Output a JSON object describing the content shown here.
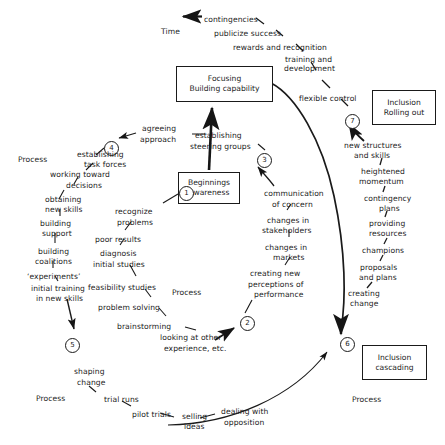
{
  "diagram": {
    "axis": {
      "time_label": "Time",
      "process_labels": [
        {
          "text": "Process",
          "x": 18,
          "y": 155
        },
        {
          "text": "Process",
          "x": 172,
          "y": 288
        },
        {
          "text": "Process",
          "x": 36,
          "y": 394
        },
        {
          "text": "Process",
          "x": 352,
          "y": 395
        }
      ]
    },
    "boxes": [
      {
        "id": "focusing",
        "line1": "Focusing",
        "line2": "Building capability",
        "x": 176,
        "y": 66,
        "w": 95,
        "h": 34
      },
      {
        "id": "beginnings",
        "line1": "Beginnings",
        "line2": "Awareness",
        "x": 178,
        "y": 172,
        "w": 60,
        "h": 30
      },
      {
        "id": "inclusion-rolling-out",
        "line1": "Inclusion",
        "line2": "Rolling out",
        "x": 372,
        "y": 90,
        "w": 62,
        "h": 33
      },
      {
        "id": "inclusion-cascading",
        "line1": "Inclusion",
        "line2": "cascading",
        "x": 362,
        "y": 345,
        "w": 63,
        "h": 33
      }
    ],
    "numbered_nodes": [
      {
        "number": "1",
        "x": 179,
        "y": 186
      },
      {
        "number": "2",
        "x": 240,
        "y": 316
      },
      {
        "number": "3",
        "x": 257,
        "y": 153
      },
      {
        "number": "4",
        "x": 104,
        "y": 141
      },
      {
        "number": "5",
        "x": 65,
        "y": 338
      },
      {
        "number": "6",
        "x": 340,
        "y": 337
      },
      {
        "number": "7",
        "x": 345,
        "y": 114
      }
    ],
    "labels": [
      {
        "id": "contingencies",
        "text": "contingencies",
        "x": 204,
        "y": 15
      },
      {
        "id": "time",
        "text": "Time",
        "x": 161,
        "y": 27
      },
      {
        "id": "publicize-success",
        "text": "publicize success",
        "x": 214,
        "y": 29
      },
      {
        "id": "rewards-and-recognition",
        "text": "rewards and recognition",
        "x": 233,
        "y": 43
      },
      {
        "id": "training-and",
        "text": "training and",
        "x": 285,
        "y": 55
      },
      {
        "id": "development",
        "text": "development",
        "x": 284,
        "y": 64
      },
      {
        "id": "flexible-control",
        "text": "flexible control",
        "x": 299,
        "y": 94
      },
      {
        "id": "new-structures",
        "text": "new structures",
        "x": 344,
        "y": 141
      },
      {
        "id": "and-skills",
        "text": "and skills",
        "x": 354,
        "y": 151
      },
      {
        "id": "heightened",
        "text": "heightened",
        "x": 361,
        "y": 167
      },
      {
        "id": "momentum",
        "text": "momentum",
        "x": 359,
        "y": 177
      },
      {
        "id": "contingency",
        "text": "contingency",
        "x": 364,
        "y": 194
      },
      {
        "id": "plans",
        "text": "plans",
        "x": 379,
        "y": 204
      },
      {
        "id": "providing",
        "text": "providing",
        "x": 369,
        "y": 219
      },
      {
        "id": "resources",
        "text": "resources",
        "x": 369,
        "y": 229
      },
      {
        "id": "champions",
        "text": "champions",
        "x": 362,
        "y": 246
      },
      {
        "id": "proposals",
        "text": "proposals",
        "x": 360,
        "y": 263
      },
      {
        "id": "and-plans",
        "text": "and plans",
        "x": 359,
        "y": 273
      },
      {
        "id": "creating",
        "text": "creating",
        "x": 348,
        "y": 289
      },
      {
        "id": "change",
        "text": "change",
        "x": 350,
        "y": 299
      },
      {
        "id": "agreeing",
        "text": "agreeing",
        "x": 142,
        "y": 124
      },
      {
        "id": "approach",
        "text": "approach",
        "x": 140,
        "y": 135
      },
      {
        "id": "establishing-steering",
        "text": "establishing",
        "x": 195,
        "y": 131
      },
      {
        "id": "steering-groups",
        "text": "steering groups",
        "x": 190,
        "y": 142
      },
      {
        "id": "establishing-task",
        "text": "establishing",
        "x": 77,
        "y": 150
      },
      {
        "id": "task-forces",
        "text": "task forces",
        "x": 84,
        "y": 160
      },
      {
        "id": "working-toward",
        "text": "working toward",
        "x": 50,
        "y": 170
      },
      {
        "id": "decisions",
        "text": "decisions",
        "x": 66,
        "y": 181
      },
      {
        "id": "obtaining",
        "text": "obtaining",
        "x": 45,
        "y": 195
      },
      {
        "id": "new-skills",
        "text": "new skills",
        "x": 45,
        "y": 205
      },
      {
        "id": "building-support-1",
        "text": "building",
        "x": 40,
        "y": 219
      },
      {
        "id": "support",
        "text": "support",
        "x": 42,
        "y": 229
      },
      {
        "id": "building-coalitions-1",
        "text": "building",
        "x": 38,
        "y": 247
      },
      {
        "id": "coalitions",
        "text": "coalitions",
        "x": 35,
        "y": 257
      },
      {
        "id": "experiments",
        "text": "‘experiments’",
        "x": 27,
        "y": 272
      },
      {
        "id": "initial-training",
        "text": "initial training",
        "x": 31,
        "y": 284
      },
      {
        "id": "in-new-skills",
        "text": "in new skills",
        "x": 36,
        "y": 294
      },
      {
        "id": "recognize",
        "text": "recognize",
        "x": 115,
        "y": 207
      },
      {
        "id": "problems",
        "text": "problems",
        "x": 117,
        "y": 218
      },
      {
        "id": "poor-results",
        "text": "poor results",
        "x": 95,
        "y": 235
      },
      {
        "id": "diagnosis",
        "text": "diagnosis",
        "x": 100,
        "y": 249
      },
      {
        "id": "initial-studies",
        "text": "initial studies",
        "x": 93,
        "y": 260
      },
      {
        "id": "feasibility-studies",
        "text": "feasibility studies",
        "x": 88,
        "y": 283
      },
      {
        "id": "problem-solving",
        "text": "problem solving",
        "x": 98,
        "y": 303
      },
      {
        "id": "brainstorming",
        "text": "brainstorming",
        "x": 117,
        "y": 322
      },
      {
        "id": "looking-at-other",
        "text": "looking at other",
        "x": 160,
        "y": 333
      },
      {
        "id": "experience-etc",
        "text": "experience, etc.",
        "x": 164,
        "y": 344
      },
      {
        "id": "communication",
        "text": "communication",
        "x": 264,
        "y": 189
      },
      {
        "id": "of-concern",
        "text": "of concern",
        "x": 272,
        "y": 200
      },
      {
        "id": "changes-in-stakeholders-1",
        "text": "changes in",
        "x": 267,
        "y": 216
      },
      {
        "id": "stakeholders",
        "text": "stakeholders",
        "x": 262,
        "y": 226
      },
      {
        "id": "changes-in-markets-1",
        "text": "changes in",
        "x": 265,
        "y": 243
      },
      {
        "id": "markets",
        "text": "markets",
        "x": 273,
        "y": 253
      },
      {
        "id": "creating-new",
        "text": "creating new",
        "x": 250,
        "y": 269
      },
      {
        "id": "perceptions-of",
        "text": "perceptions of",
        "x": 248,
        "y": 280
      },
      {
        "id": "performance",
        "text": "performance",
        "x": 254,
        "y": 290
      },
      {
        "id": "shaping",
        "text": "shaping",
        "x": 74,
        "y": 367
      },
      {
        "id": "change-bottom",
        "text": "change",
        "x": 77,
        "y": 378
      },
      {
        "id": "trial-runs",
        "text": "trial runs",
        "x": 104,
        "y": 395
      },
      {
        "id": "pilot-trials",
        "text": "pilot trials",
        "x": 132,
        "y": 410
      },
      {
        "id": "selling",
        "text": "selling",
        "x": 182,
        "y": 412
      },
      {
        "id": "ideas",
        "text": "ideas",
        "x": 184,
        "y": 422
      },
      {
        "id": "dealing-with",
        "text": "dealing with",
        "x": 221,
        "y": 407
      },
      {
        "id": "opposition",
        "text": "opposition",
        "x": 224,
        "y": 418
      }
    ],
    "footer_note": "Figure caption area"
  }
}
